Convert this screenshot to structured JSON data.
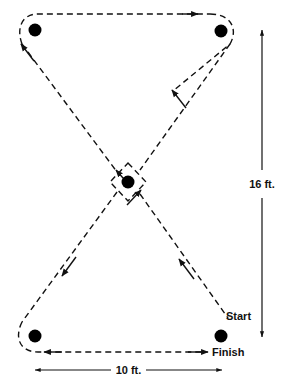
{
  "figure": {
    "type": "diagram",
    "background_color": "#ffffff",
    "line_color": "#111111",
    "cone_color": "#000000",
    "width_px": 283,
    "height_px": 390
  },
  "labels": {
    "start": "Start",
    "finish": "Finish",
    "height_dimension": "16 ft.",
    "width_dimension": "10 ft."
  },
  "cones": [
    {
      "id": "cone-top-left",
      "name": "top-left-cone",
      "x": 35,
      "y": 30
    },
    {
      "id": "cone-top-right",
      "name": "top-right-cone",
      "x": 221,
      "y": 31
    },
    {
      "id": "cone-center",
      "name": "center-cone",
      "x": 128,
      "y": 182
    },
    {
      "id": "cone-bottom-left",
      "name": "bottom-left-cone",
      "x": 35,
      "y": 336
    },
    {
      "id": "cone-bottom-right",
      "name": "bottom-right-cone",
      "x": 221,
      "y": 336
    }
  ],
  "dimensions": {
    "vertical": {
      "label": "16 ft.",
      "from_y": 30,
      "to_y": 336,
      "x": 262
    },
    "horizontal": {
      "label": "10 ft.",
      "from_x": 35,
      "to_x": 222,
      "y": 370
    }
  },
  "path": {
    "style": "dashed",
    "description": "Figure-eight course: start at lower right, run up-left through center diamond to top-left cone, around top-left, down-right diagonal... crossing at center, finishing along the bottom.",
    "direction_markers": [
      {
        "name": "arrow-top-edge-right",
        "x": 196,
        "y": 16,
        "direction": "right"
      },
      {
        "name": "arrow-upper-left-diagonal",
        "x": 22,
        "y": 44,
        "direction": "down-left"
      },
      {
        "name": "arrow-upper-right-diagonal",
        "x": 173,
        "y": 91,
        "direction": "up-right"
      },
      {
        "name": "arrow-center-upper-left",
        "x": 118,
        "y": 173,
        "direction": "up-left"
      },
      {
        "name": "arrow-center-lower-right",
        "x": 139,
        "y": 193,
        "direction": "up-right"
      },
      {
        "name": "arrow-lower-left-diagonal",
        "x": 63,
        "y": 274,
        "direction": "down-left"
      },
      {
        "name": "arrow-lower-right-diagonal",
        "x": 180,
        "y": 260,
        "direction": "up-left"
      },
      {
        "name": "arrow-bottom-edge-left",
        "x": 45,
        "y": 352,
        "direction": "left"
      },
      {
        "name": "arrow-bottom-edge-finish",
        "x": 206,
        "y": 352,
        "direction": "right"
      }
    ]
  }
}
